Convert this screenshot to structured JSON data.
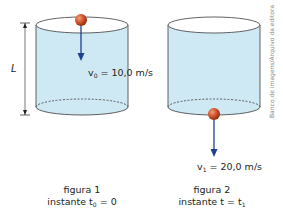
{
  "colors": {
    "water": "#cfe9f4",
    "water_edge": "#3a3a3a",
    "ball": "#d2542c",
    "arrow": "#1f3f8f",
    "text": "#231f20",
    "credit": "#8a8a8a"
  },
  "figure1": {
    "length_label": "L",
    "velocity_symbol": "v",
    "velocity_sub": "0",
    "velocity_value": " = 10,0 m/s",
    "caption_title": "figura 1",
    "caption_prefix": "instante t",
    "caption_sub": "0",
    "caption_suffix": " = 0"
  },
  "figure2": {
    "velocity_symbol": "v",
    "velocity_sub": "1",
    "velocity_value": " = 20,0 m/s",
    "caption_title": "figura 2",
    "caption_prefix": "instante t = t",
    "caption_sub": "1",
    "caption_suffix": ""
  },
  "credit": "Banco de imagens/Arquivo da editora"
}
